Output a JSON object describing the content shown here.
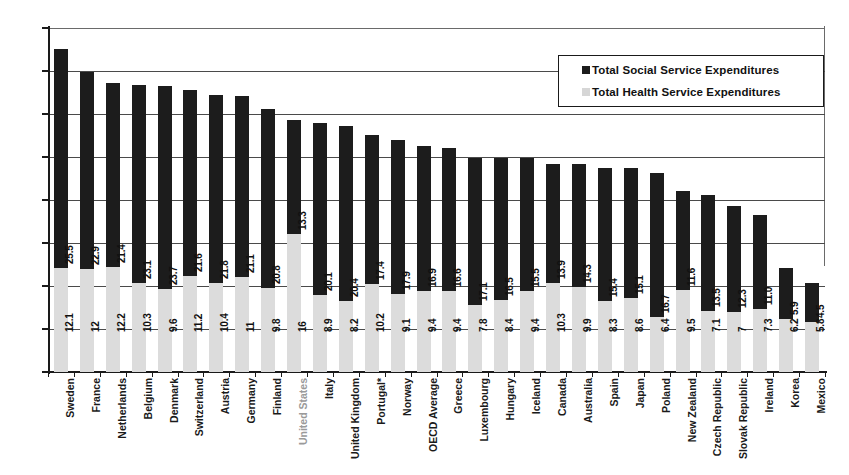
{
  "chart_data": {
    "type": "bar",
    "subtype": "stacked-bar",
    "title": "",
    "xlabel": "",
    "ylabel": "",
    "ylim": [
      0,
      40
    ],
    "yticks": [
      0,
      5,
      10,
      15,
      20,
      25,
      30,
      35,
      40
    ],
    "grid": true,
    "legend_position": "top-right",
    "categories": [
      "Sweden",
      "France",
      "Netherlands",
      "Belgium",
      "Denmark",
      "Switzerland",
      "Austria",
      "Germany",
      "Finland",
      "United States",
      "Italy",
      "United Kingdom",
      "Portugal*",
      "Norway",
      "OECD Average",
      "Greece",
      "Luxembourg",
      "Hungary",
      "Iceland",
      "Canada",
      "Australia",
      "Spain",
      "Japan",
      "Poland",
      "New Zealand",
      "Czech Republic",
      "Slovak Republic",
      "Ireland",
      "Korea",
      "Mexico"
    ],
    "series": [
      {
        "name": "Total Health Service Expenditures",
        "color": "#dcdcdc",
        "values": [
          12.1,
          12,
          12.2,
          10.3,
          9.6,
          11.2,
          10.4,
          11,
          9.8,
          16,
          8.9,
          8.2,
          10.2,
          9.1,
          9.4,
          9.4,
          7.8,
          8.4,
          9.4,
          10.3,
          9.9,
          8.3,
          8.6,
          6.4,
          9.5,
          7.1,
          7,
          7.3,
          6.2,
          5.8
        ]
      },
      {
        "name": "Total Social Service Expenditures",
        "color": "#1c1c1c",
        "values": [
          25.5,
          22.9,
          21.4,
          23.1,
          23.7,
          21.6,
          21.8,
          21.1,
          20.8,
          13.3,
          20.1,
          20.4,
          17.4,
          17.9,
          16.9,
          16.6,
          17.1,
          16.5,
          15.5,
          13.9,
          14.3,
          15.4,
          15.1,
          16.7,
          11.6,
          13.5,
          12.3,
          11.0,
          5.9,
          4.5
        ]
      }
    ],
    "value_labels": {
      "social": [
        "25.5",
        "22.9",
        "21.4",
        "23.1",
        "23.7",
        "21.6",
        "21.8",
        "21.1",
        "20.8",
        "13.3",
        "20.1",
        "20.4",
        "17.4",
        "17.9",
        "16.9",
        "16.6",
        "17.1",
        "16.5",
        "15.5",
        "13.9",
        "14.3",
        "15.4",
        "15.1",
        "16.7",
        "11.6",
        "13.5",
        "12.3",
        "11.0",
        "5.9",
        "4.5"
      ],
      "health": [
        "12.1",
        "12",
        "12.2",
        "10.3",
        "9.6",
        "11.2",
        "10.4",
        "11",
        "9.8",
        "16",
        "8.9",
        "8.2",
        "10.2",
        "9.1",
        "9.4",
        "9.4",
        "7.8",
        "8.4",
        "9.4",
        "10.3",
        "9.9",
        "8.3",
        "8.6",
        "6.4",
        "9.5",
        "7.1",
        "7",
        "7.3",
        "6.2",
        "5.8"
      ]
    },
    "muted_categories": [
      "United States"
    ]
  },
  "legend": {
    "items": [
      {
        "label": "Total Social Service Expenditures",
        "swatch": "social"
      },
      {
        "label": "Total Health Service Expenditures",
        "swatch": "health"
      }
    ]
  },
  "colors": {
    "social": "#1c1c1c",
    "health": "#dcdcdc",
    "axis": "#1a1a1a",
    "grid": "#4a4a4a",
    "muted_text": "#9a9a9a"
  }
}
